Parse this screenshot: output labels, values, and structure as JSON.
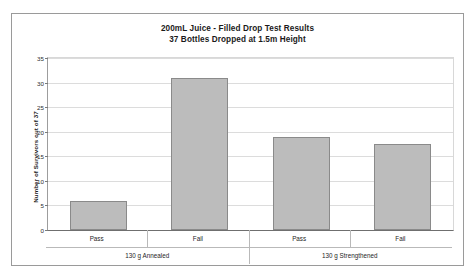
{
  "chart_data": {
    "type": "bar",
    "title": "200mL Juice -  Filled Drop Test Results",
    "subtitle": "37 Bottles Dropped at 1.5m Height",
    "xlabel": "",
    "ylabel": "Number of Survivors out of 37",
    "ylim": [
      0,
      35
    ],
    "ytick_interval": 5,
    "yticks": [
      35,
      30,
      25,
      20,
      15,
      10,
      5,
      0
    ],
    "ytick_labels": [
      "35",
      "30",
      "25",
      "20",
      "15",
      "10",
      "5",
      "0"
    ],
    "grid": true,
    "legend": "none",
    "categories": [
      "Pass",
      "Fail",
      "Pass",
      "Fail"
    ],
    "groups": [
      {
        "label": "130 g Annealed",
        "categories": [
          "Pass",
          "Fail"
        ],
        "values": [
          6,
          31
        ]
      },
      {
        "label": "130 g Strengthened",
        "categories": [
          "Pass",
          "Fail"
        ],
        "values": [
          19,
          17.5
        ]
      }
    ],
    "values": [
      6,
      31,
      19,
      17.5
    ],
    "bar_color": "#bcbcbc",
    "bar_border_color": "#8a8a8a",
    "gridline_color": "#dcdcdc",
    "axis_color": "#6f6f6f",
    "frame_color": "#9a9a9a"
  }
}
